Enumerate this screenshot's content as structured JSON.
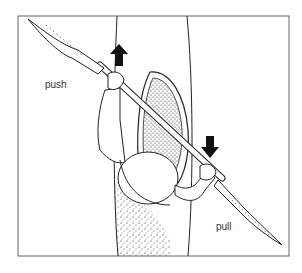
{
  "figure": {
    "labels": {
      "push": "push",
      "pull": "pull"
    },
    "arrows": [
      {
        "name": "push-arrow",
        "direction": "up"
      },
      {
        "name": "pull-arrow",
        "direction": "down"
      }
    ],
    "colors": {
      "ink": "#111111",
      "frame": "#555555",
      "background": "#ffffff"
    }
  }
}
